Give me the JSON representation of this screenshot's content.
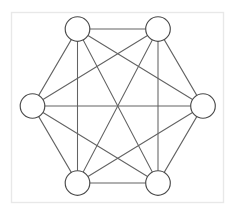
{
  "figure": {
    "kind": "graph-diagram",
    "name": "complete-graph-k6",
    "title": "",
    "caption": "",
    "background_color": "#ffffff",
    "frame": {
      "x": 11.5,
      "y": 12.5,
      "width": 212,
      "height": 190,
      "stroke_color": "#e8e8e8",
      "fill_color": "#ffffff",
      "stroke_width": 1.4
    },
    "node_style": {
      "radius": 12.3,
      "fill_color": "#ffffff",
      "stroke_color": "#4a4a4a",
      "stroke_width": 1.15
    },
    "edge_style": {
      "stroke_color": "#636363",
      "stroke_width": 1.05
    },
    "node_count": 6,
    "edge_count": 15,
    "nodes": [
      {
        "id": "n0",
        "label": "",
        "x": 77.5,
        "y": 29.0,
        "position": "top-left"
      },
      {
        "id": "n1",
        "label": "",
        "x": 158.0,
        "y": 29.0,
        "position": "top-right"
      },
      {
        "id": "n2",
        "label": "",
        "x": 203.0,
        "y": 106.0,
        "position": "right"
      },
      {
        "id": "n3",
        "label": "",
        "x": 158.0,
        "y": 183.0,
        "position": "bottom-right"
      },
      {
        "id": "n4",
        "label": "",
        "x": 77.5,
        "y": 183.0,
        "position": "bottom-left"
      },
      {
        "id": "n5",
        "label": "",
        "x": 32.5,
        "y": 106.0,
        "position": "left"
      }
    ],
    "edges": [
      {
        "from": "n0",
        "to": "n1",
        "kind": "hexagon-side"
      },
      {
        "from": "n1",
        "to": "n2",
        "kind": "hexagon-side"
      },
      {
        "from": "n2",
        "to": "n3",
        "kind": "hexagon-side"
      },
      {
        "from": "n3",
        "to": "n4",
        "kind": "hexagon-side"
      },
      {
        "from": "n4",
        "to": "n5",
        "kind": "hexagon-side"
      },
      {
        "from": "n5",
        "to": "n0",
        "kind": "hexagon-side"
      },
      {
        "from": "n0",
        "to": "n2",
        "kind": "short-diagonal"
      },
      {
        "from": "n1",
        "to": "n3",
        "kind": "short-diagonal"
      },
      {
        "from": "n2",
        "to": "n4",
        "kind": "short-diagonal"
      },
      {
        "from": "n3",
        "to": "n5",
        "kind": "short-diagonal"
      },
      {
        "from": "n4",
        "to": "n0",
        "kind": "short-diagonal"
      },
      {
        "from": "n5",
        "to": "n1",
        "kind": "short-diagonal"
      },
      {
        "from": "n0",
        "to": "n3",
        "kind": "long-diagonal"
      },
      {
        "from": "n1",
        "to": "n4",
        "kind": "long-diagonal"
      },
      {
        "from": "n2",
        "to": "n5",
        "kind": "long-diagonal"
      }
    ]
  }
}
